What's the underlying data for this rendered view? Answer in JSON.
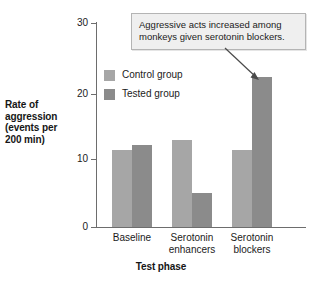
{
  "chart_data": {
    "type": "bar",
    "title": "",
    "xlabel": "Test phase",
    "ylabel": "Rate of aggression (events per 200 min)",
    "ylabel_lines": [
      "Rate of",
      "aggression",
      "(events per",
      "200 min)"
    ],
    "categories": [
      "Baseline",
      "Serotonin enhancers",
      "Serotonin blockers"
    ],
    "category_lines": [
      [
        "Baseline"
      ],
      [
        "Serotonin",
        "enhancers"
      ],
      [
        "Serotonin",
        "blockers"
      ]
    ],
    "series": [
      {
        "name": "Control group",
        "values": [
          11.3,
          12.8,
          11.2
        ],
        "color": "#a6a6a6"
      },
      {
        "name": "Tested group",
        "values": [
          12.0,
          5.0,
          22.0
        ],
        "color": "#8b8b8b"
      }
    ],
    "ylim": [
      0,
      30
    ],
    "yticks": [
      0,
      10,
      20,
      30
    ],
    "ytick_labels": [
      "0",
      "10",
      "20",
      "30"
    ],
    "grid": false,
    "legend_position": "upper-left-inside"
  },
  "annotation": {
    "text": "Aggressive acts increased among monkeys given serotonin blockers.",
    "lines": [
      "Aggressive acts increased among",
      "monkeys given serotonin blockers."
    ],
    "points_to": "Serotonin blockers - Tested group bar"
  },
  "legend": {
    "items": [
      {
        "label": "Control group"
      },
      {
        "label": "Tested group"
      }
    ]
  },
  "axis": {
    "ytick_0": "0",
    "ytick_1": "10",
    "ytick_2": "20",
    "ytick_3": "30"
  }
}
